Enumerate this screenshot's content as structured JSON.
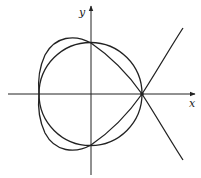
{
  "diagram": {
    "type": "curve-plot",
    "axes": {
      "x_label": "x",
      "y_label": "y",
      "origin_px": [
        91,
        94
      ]
    },
    "curves": [
      {
        "name": "circle",
        "description": "circle centered at origin passing through the node point"
      },
      {
        "name": "nodal-cubic",
        "description": "cubic curve with a node on the positive x-axis, loop enclosing origin"
      }
    ],
    "colors": {
      "stroke": "#222222",
      "background": "#ffffff"
    }
  }
}
